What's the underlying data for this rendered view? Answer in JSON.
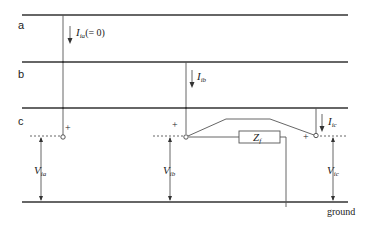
{
  "diagram": {
    "buses": [
      {
        "id": "a",
        "label": "a"
      },
      {
        "id": "b",
        "label": "b"
      },
      {
        "id": "c",
        "label": "c"
      }
    ],
    "currents": [
      {
        "id": "Ia",
        "symbol": "I",
        "subscript": "ia",
        "suffix": "(= 0)"
      },
      {
        "id": "Ib",
        "symbol": "I",
        "subscript": "ib",
        "suffix": ""
      },
      {
        "id": "Ic",
        "symbol": "I",
        "subscript": "ic",
        "suffix": ""
      }
    ],
    "voltages": [
      {
        "id": "Va",
        "symbol": "V",
        "subscript": "ia"
      },
      {
        "id": "Vb",
        "symbol": "V",
        "subscript": "ib"
      },
      {
        "id": "Vc",
        "symbol": "V",
        "subscript": "ic"
      }
    ],
    "impedance": {
      "symbol": "Z",
      "subscript": "f"
    },
    "polarity_mark": "+",
    "ground_label": "ground",
    "line_color": "#333333"
  }
}
